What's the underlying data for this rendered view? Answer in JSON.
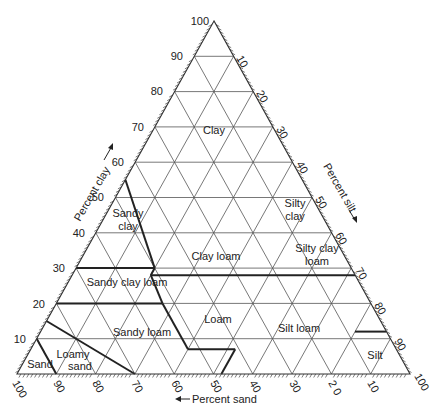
{
  "diagram": {
    "type": "ternary-soil-texture-triangle",
    "axes": {
      "clay": {
        "title": "Percent clay",
        "arrow": "up",
        "ticks": [
          "10",
          "20",
          "30",
          "40",
          "50",
          "60",
          "70",
          "80",
          "90",
          "100"
        ]
      },
      "silt": {
        "title": "Percent silt",
        "arrow": "down",
        "ticks": [
          "10",
          "20",
          "30",
          "40",
          "50",
          "60",
          "70",
          "80",
          "90",
          "100"
        ]
      },
      "sand": {
        "title": "Percent sand",
        "arrow": "left",
        "ticks": [
          "100",
          "90",
          "80",
          "70",
          "60",
          "50",
          "40",
          "30",
          "2 0",
          "10"
        ]
      }
    },
    "regions": [
      {
        "id": "clay",
        "lines": [
          "Clay"
        ]
      },
      {
        "id": "silty-clay",
        "lines": [
          "Silty",
          "clay"
        ]
      },
      {
        "id": "sandy-clay",
        "lines": [
          "Sandy",
          "clay"
        ]
      },
      {
        "id": "clay-loam",
        "lines": [
          "Clay loam"
        ]
      },
      {
        "id": "silty-clay-loam",
        "lines": [
          "Silty clay",
          "loam"
        ]
      },
      {
        "id": "sandy-clay-loam",
        "lines": [
          "Sandy clay loam"
        ]
      },
      {
        "id": "loam",
        "lines": [
          "Loam"
        ]
      },
      {
        "id": "silt-loam",
        "lines": [
          "Silt loam"
        ]
      },
      {
        "id": "sandy-loam",
        "lines": [
          "Sandy loam"
        ]
      },
      {
        "id": "silt",
        "lines": [
          "Silt"
        ]
      },
      {
        "id": "loamy-sand",
        "lines": [
          "Loamy",
          "sand"
        ]
      },
      {
        "id": "sand",
        "lines": [
          "Sand"
        ]
      }
    ]
  }
}
